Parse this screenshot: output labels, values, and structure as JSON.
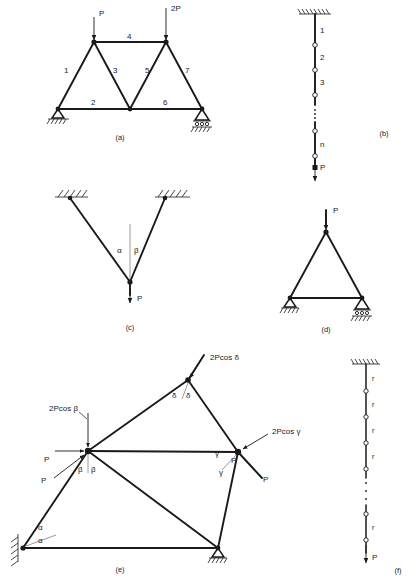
{
  "figure": {
    "background": "#ffffff",
    "ink": "#1a1a1a",
    "captions": [
      "(a)",
      "(b)",
      "(c)",
      "(d)",
      "(e)",
      "(f)"
    ]
  },
  "panel_a": {
    "caption": "(a)",
    "description": "Planar pin-jointed truss with seven numbered members, two vertical point loads, pinned support at left and roller support at right.",
    "member_labels": [
      "1",
      "2",
      "3",
      "4",
      "5",
      "6",
      "7"
    ],
    "loads": [
      {
        "label": "P",
        "at": "upper-left-node",
        "direction": "down"
      },
      {
        "label": "2P",
        "at": "upper-right-node",
        "direction": "down"
      }
    ],
    "supports": [
      "pin-support-left",
      "roller-support-right"
    ]
  },
  "panel_b": {
    "caption": "(b)",
    "description": "Vertical chain of n pin-connected links hanging from a fixed ceiling, loaded by P at the bottom.",
    "link_labels": [
      "1",
      "2",
      "3",
      "n"
    ],
    "continuation": "vertical-dots",
    "load": {
      "label": "P",
      "direction": "down"
    },
    "support": "fixed-ceiling-hatched"
  },
  "panel_c": {
    "caption": "(c)",
    "description": "Two inclined bars from two hatched fixed supports meeting at a common joint carrying load P; the vertical reference line defines angles alpha and beta.",
    "angle_labels": [
      "α",
      "β"
    ],
    "load": {
      "label": "P",
      "direction": "down"
    },
    "supports": [
      "hatched-fixed-left",
      "hatched-fixed-right"
    ]
  },
  "panel_d": {
    "caption": "(d)",
    "description": "Three-bar triangular truss with vertical load P at apex, pin support at lower left and roller support at lower right.",
    "load": {
      "label": "P",
      "direction": "down"
    },
    "supports": [
      "pin-support-left",
      "roller-support-right"
    ]
  },
  "panel_e": {
    "caption": "(e)",
    "description": "Irregular multi-bar frame with resultant joint forces expressed as 2P cos of the half angles at four joints.",
    "force_labels": [
      "2Pcos β",
      "2Pcos δ",
      "2Pcos γ"
    ],
    "p_labels": [
      "P",
      "P",
      "P",
      "P"
    ],
    "angle_labels": [
      "α",
      "α",
      "β",
      "β",
      "γ",
      "γ",
      "δ",
      "δ"
    ],
    "supports": [
      "hatched-pin-left",
      "roller-support-bottom-right"
    ]
  },
  "panel_f": {
    "caption": "(f)",
    "description": "Vertical chain of identical pin-connected links each labelled r, hanging from a hatched ceiling and loaded by P at the bottom.",
    "link_labels": [
      "r",
      "r",
      "r",
      "r",
      "r"
    ],
    "continuation": "vertical-dots",
    "load": {
      "label": "P",
      "direction": "down"
    },
    "support": "hatched-ceiling"
  }
}
